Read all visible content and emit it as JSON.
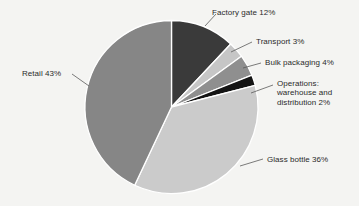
{
  "chart_data": {
    "type": "pie",
    "title": "",
    "subtitle": "",
    "xlabel": "",
    "ylabel": "",
    "legend_position": "none",
    "grid": false,
    "start_angle_deg": 0,
    "direction": "clockwise",
    "categories": [
      "Factory gate",
      "Transport",
      "Bulk packaging",
      "Operations: warehouse and distribution",
      "Glass bottle",
      "Retail"
    ],
    "values": [
      12,
      3,
      4,
      2,
      36,
      43
    ],
    "value_unit": "%",
    "colors": [
      "#3a3a3a",
      "#c6c6c6",
      "#8f8f8f",
      "#141414",
      "#cbcbcb",
      "#868686"
    ],
    "slices": [
      {
        "name": "Factory gate",
        "value": 12,
        "label": "Factory gate 12%",
        "color": "#3a3a3a",
        "multiline": false
      },
      {
        "name": "Transport",
        "value": 3,
        "label": "Transport 3%",
        "color": "#c6c6c6",
        "multiline": false
      },
      {
        "name": "Bulk packaging",
        "value": 4,
        "label": "Bulk packaging 4%",
        "color": "#8f8f8f",
        "multiline": false
      },
      {
        "name": "Operations: warehouse and distribution",
        "value": 2,
        "label": "Operations: warehouse and distribution 2%",
        "color": "#141414",
        "multiline": true
      },
      {
        "name": "Glass bottle",
        "value": 36,
        "label": "Glass bottle 36%",
        "color": "#cbcbcb",
        "multiline": false
      },
      {
        "name": "Retail",
        "value": 43,
        "label": "Retail 43%",
        "color": "#868686",
        "multiline": false
      }
    ],
    "background_color": "#f4f4f2",
    "separator_color": "#ffffff",
    "text_color": "#2b2b2b",
    "leader_line_color": "#5a5a5a"
  }
}
